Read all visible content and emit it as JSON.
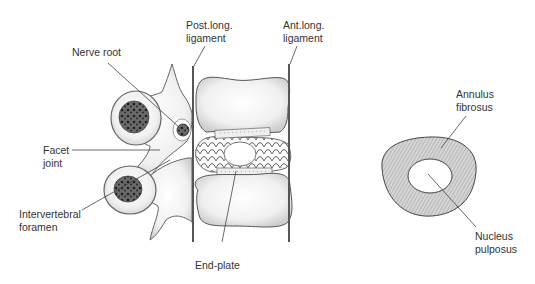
{
  "diagram": {
    "left_panel": {
      "title": "Lateral view of lumbar motion segment",
      "labels": {
        "nerve_root": "Nerve root",
        "post_long_ligament": "Post.long.\nligament",
        "ant_long_ligament": "Ant.long.\nligament",
        "facet_joint": "Facet\njoint",
        "intervertebral_foramen": "Intervertebral\nforamen",
        "end_plate": "End-plate"
      }
    },
    "right_panel": {
      "title": "Axial view of intervertebral disc",
      "labels": {
        "annulus_fibrosus": "Annulus\nfibrosus",
        "nucleus_pulposus": "Nucleus\npulposus"
      }
    },
    "colors": {
      "outline": "#555555",
      "bone_fill": "#eeeeee",
      "cancellous": "#444444",
      "annulus_hatch": "#999999",
      "text": "#333333"
    }
  }
}
